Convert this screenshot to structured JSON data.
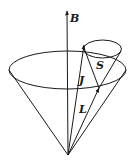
{
  "diagram": {
    "labels": {
      "field": "B",
      "total": "J",
      "orbital": "L",
      "spin": "S"
    },
    "colors": {
      "stroke": "#1a1a1a",
      "background": "#ffffff"
    }
  }
}
